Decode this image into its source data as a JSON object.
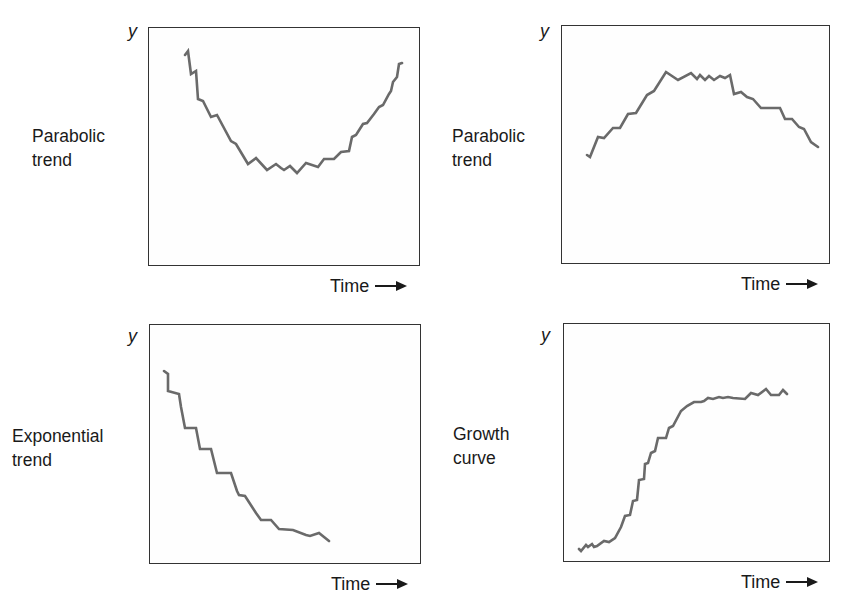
{
  "panels": [
    {
      "id": "top-left",
      "title": "Parabolic\ntrend",
      "y_label": "y",
      "x_label": "Time"
    },
    {
      "id": "top-right",
      "title": "Parabolic\ntrend",
      "y_label": "y",
      "x_label": "Time"
    },
    {
      "id": "bottom-left",
      "title": "Exponential\ntrend",
      "y_label": "y",
      "x_label": "Time"
    },
    {
      "id": "bottom-right",
      "title": "Growth\ncurve",
      "y_label": "y",
      "x_label": "Time"
    }
  ],
  "colors": {
    "line": "#6a6a6a",
    "frame": "#333333",
    "text": "#1a1a1a"
  },
  "chart_data": [
    {
      "type": "line",
      "title": "Parabolic trend (U-shaped)",
      "xlabel": "Time →",
      "ylabel": "y",
      "grid": false,
      "note": "Coordinates are relative to panel frame (x: 0-272 left→right, y: 0-239 top→bottom in pixel space)",
      "points": [
        [
          36,
          27
        ],
        [
          39,
          23
        ],
        [
          42,
          46
        ],
        [
          47,
          43
        ],
        [
          49,
          71
        ],
        [
          54,
          73
        ],
        [
          62,
          89
        ],
        [
          68,
          87
        ],
        [
          82,
          113
        ],
        [
          87,
          116
        ],
        [
          99,
          136
        ],
        [
          107,
          130
        ],
        [
          118,
          142
        ],
        [
          127,
          136
        ],
        [
          132,
          140
        ],
        [
          135,
          142
        ],
        [
          141,
          138
        ],
        [
          148,
          145
        ],
        [
          157,
          135
        ],
        [
          169,
          139
        ],
        [
          175,
          131
        ],
        [
          185,
          131
        ],
        [
          192,
          124
        ],
        [
          200,
          123
        ],
        [
          203,
          109
        ],
        [
          207,
          107
        ],
        [
          214,
          96
        ],
        [
          218,
          95
        ],
        [
          225,
          86
        ],
        [
          230,
          79
        ],
        [
          234,
          77
        ],
        [
          240,
          66
        ],
        [
          242,
          63
        ],
        [
          244,
          54
        ],
        [
          248,
          49
        ],
        [
          250,
          36
        ],
        [
          253,
          35
        ]
      ]
    },
    {
      "type": "line",
      "title": "Parabolic trend (inverted)",
      "xlabel": "Time →",
      "ylabel": "y",
      "grid": false,
      "points": [
        [
          25,
          129
        ],
        [
          28,
          131
        ],
        [
          36,
          111
        ],
        [
          42,
          112
        ],
        [
          51,
          102
        ],
        [
          58,
          102
        ],
        [
          66,
          88
        ],
        [
          74,
          87
        ],
        [
          85,
          69
        ],
        [
          92,
          65
        ],
        [
          104,
          46
        ],
        [
          116,
          54
        ],
        [
          129,
          47
        ],
        [
          135,
          53
        ],
        [
          138,
          49
        ],
        [
          143,
          54
        ],
        [
          147,
          50
        ],
        [
          152,
          54
        ],
        [
          158,
          50
        ],
        [
          163,
          52
        ],
        [
          168,
          49
        ],
        [
          172,
          68
        ],
        [
          179,
          66
        ],
        [
          185,
          71
        ],
        [
          191,
          73
        ],
        [
          199,
          82
        ],
        [
          211,
          82
        ],
        [
          218,
          82
        ],
        [
          223,
          93
        ],
        [
          230,
          93
        ],
        [
          237,
          101
        ],
        [
          242,
          103
        ],
        [
          249,
          116
        ],
        [
          256,
          121
        ]
      ]
    },
    {
      "type": "line",
      "title": "Exponential trend",
      "xlabel": "Time →",
      "ylabel": "y",
      "grid": false,
      "points": [
        [
          14,
          46
        ],
        [
          18,
          49
        ],
        [
          18,
          66
        ],
        [
          29,
          69
        ],
        [
          31,
          82
        ],
        [
          35,
          103
        ],
        [
          46,
          103
        ],
        [
          50,
          124
        ],
        [
          61,
          124
        ],
        [
          67,
          148
        ],
        [
          81,
          148
        ],
        [
          87,
          166
        ],
        [
          89,
          170
        ],
        [
          95,
          171
        ],
        [
          106,
          188
        ],
        [
          111,
          195
        ],
        [
          121,
          195
        ],
        [
          129,
          204
        ],
        [
          143,
          205
        ],
        [
          156,
          210
        ],
        [
          160,
          211
        ],
        [
          169,
          208
        ],
        [
          179,
          216
        ]
      ]
    },
    {
      "type": "line",
      "title": "Growth curve (S-shaped)",
      "xlabel": "Time →",
      "ylabel": "y",
      "grid": false,
      "points": [
        [
          15,
          225
        ],
        [
          17,
          227
        ],
        [
          22,
          221
        ],
        [
          24,
          223
        ],
        [
          28,
          220
        ],
        [
          30,
          223
        ],
        [
          33,
          222
        ],
        [
          40,
          217
        ],
        [
          45,
          218
        ],
        [
          51,
          214
        ],
        [
          57,
          203
        ],
        [
          61,
          192
        ],
        [
          66,
          191
        ],
        [
          69,
          177
        ],
        [
          73,
          176
        ],
        [
          75,
          156
        ],
        [
          80,
          155
        ],
        [
          81,
          140
        ],
        [
          84,
          139
        ],
        [
          87,
          129
        ],
        [
          91,
          127
        ],
        [
          94,
          114
        ],
        [
          102,
          114
        ],
        [
          105,
          104
        ],
        [
          109,
          102
        ],
        [
          117,
          87
        ],
        [
          123,
          82
        ],
        [
          130,
          78
        ],
        [
          137,
          78
        ],
        [
          140,
          77
        ],
        [
          144,
          74
        ],
        [
          149,
          75
        ],
        [
          155,
          73
        ],
        [
          159,
          74
        ],
        [
          164,
          73
        ],
        [
          169,
          74
        ],
        [
          181,
          75
        ],
        [
          187,
          69
        ],
        [
          194,
          71
        ],
        [
          202,
          65
        ],
        [
          207,
          71
        ],
        [
          215,
          71
        ],
        [
          219,
          66
        ],
        [
          223,
          70
        ]
      ]
    }
  ]
}
